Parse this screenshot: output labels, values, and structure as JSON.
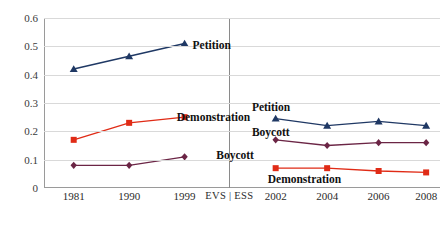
{
  "chart_data": {
    "type": "line",
    "title": "",
    "xlabel": "",
    "ylabel": "",
    "ylim": [
      0,
      0.6
    ],
    "ytick_step": 0.1,
    "grid": true,
    "legend": "inline-labels",
    "panels": [
      {
        "name": "EVS",
        "categories": [
          "1981",
          "1990",
          "1999"
        ]
      },
      {
        "name": "ESS",
        "categories": [
          "2002",
          "2004",
          "2006",
          "2008"
        ]
      }
    ],
    "panel_separator_label": "EVS | ESS",
    "categories": [
      "1981",
      "1990",
      "1999",
      "EVS | ESS",
      "2002",
      "2004",
      "2006",
      "2008"
    ],
    "yticks": [
      "0",
      "0.1",
      "0.2",
      "0.3",
      "0.4",
      "0.5",
      "0.6"
    ],
    "series": [
      {
        "name": "Petition",
        "color": "#1f3864",
        "marker": "triangle",
        "evs": [
          0.42,
          0.465,
          0.51
        ],
        "ess": [
          0.245,
          0.22,
          0.235,
          0.22
        ]
      },
      {
        "name": "Demonstration",
        "color": "#e02b16",
        "marker": "square",
        "evs": [
          0.17,
          0.23,
          0.25
        ],
        "ess": [
          0.07,
          0.07,
          0.06,
          0.055
        ]
      },
      {
        "name": "Boycott",
        "color": "#6b2545",
        "marker": "diamond",
        "evs": [
          0.08,
          0.08,
          0.11
        ],
        "ess": [
          0.17,
          0.15,
          0.16,
          0.16
        ]
      }
    ],
    "inline_labels": [
      {
        "text": "Petition",
        "panel": "EVS",
        "x": 0.375,
        "y": 0.505
      },
      {
        "text": "Demonstration",
        "panel": "EVS",
        "x": 0.335,
        "y": 0.252
      },
      {
        "text": "Boycott",
        "panel": "EVS",
        "x": 0.435,
        "y": 0.118
      },
      {
        "text": "Petition",
        "panel": "ESS",
        "x": 0.525,
        "y": 0.286
      },
      {
        "text": "Boycott",
        "panel": "ESS",
        "x": 0.525,
        "y": 0.196
      },
      {
        "text": "Demonstration",
        "panel": "ESS",
        "x": 0.565,
        "y": 0.031
      }
    ]
  }
}
